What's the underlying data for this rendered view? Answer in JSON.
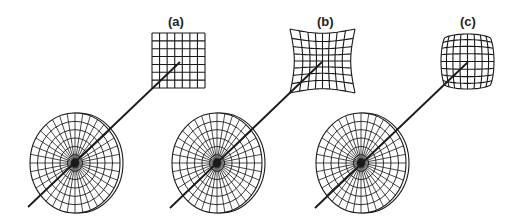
{
  "figure": {
    "panels": [
      {
        "label": "(a)",
        "distortion": "none",
        "label_pos": [
          168,
          15
        ],
        "lens": {
          "cx": 75,
          "cy": 163,
          "rx": 45,
          "ry": 50
        },
        "ray": {
          "x1": 28,
          "y1": 207,
          "x2": 180,
          "y2": 62
        },
        "grid": {
          "x": 152,
          "y": 33,
          "w": 53,
          "h": 55,
          "cols": 7,
          "rows": 7,
          "k": 0
        }
      },
      {
        "label": "(b)",
        "distortion": "pincushion",
        "label_pos": [
          317,
          15
        ],
        "lens": {
          "cx": 217,
          "cy": 163,
          "rx": 45,
          "ry": 50
        },
        "ray": {
          "x1": 170,
          "y1": 208,
          "x2": 322,
          "y2": 62
        },
        "grid": {
          "x": 290,
          "y": 29,
          "w": 65,
          "h": 64,
          "cols": 8,
          "rows": 8,
          "k": 0.18
        }
      },
      {
        "label": "(c)",
        "distortion": "barrel",
        "label_pos": [
          460,
          15
        ],
        "lens": {
          "cx": 361,
          "cy": 163,
          "rx": 45,
          "ry": 50
        },
        "ray": {
          "x1": 315,
          "y1": 208,
          "x2": 468,
          "y2": 62
        },
        "grid": {
          "x": 441,
          "y": 34,
          "w": 53,
          "h": 55,
          "cols": 8,
          "rows": 8,
          "k": -0.12
        }
      }
    ],
    "lens_style": {
      "rings": 6,
      "spokes": 36,
      "rim_offset": 3
    },
    "colors": {
      "stroke": "#1a1a1a",
      "background": "#ffffff"
    }
  }
}
